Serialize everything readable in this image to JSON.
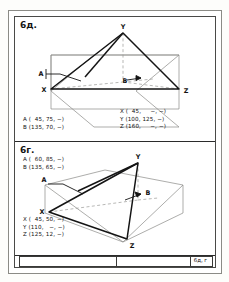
{
  "page": {
    "kind": "technical-drawing-sheet",
    "panels": [
      {
        "id": "top",
        "label": "6д.",
        "figure": {
          "vertex_labels": [
            "Y",
            "A",
            "X",
            "B",
            "Z"
          ],
          "apex": "Y",
          "left_base": "X",
          "right_base": "Z",
          "plane_markers": [
            "A",
            "B"
          ]
        },
        "coords_left": [
          "A (  45, 75, −)",
          "B (135, 70, −)"
        ],
        "coords_right": [
          "X (  45,     −, −)",
          "Y (100, 125, −)",
          "Z (160,     −, −)"
        ]
      },
      {
        "id": "bottom",
        "label": "6г.",
        "figure": {
          "vertex_labels": [
            "Y",
            "A",
            "X",
            "B",
            "Z"
          ],
          "apex": "Y",
          "left_base": "X",
          "right_base": "Z",
          "plane_markers": [
            "A",
            "B"
          ]
        },
        "coords_left": [
          "A (  60, 85, −)",
          "B (135, 65, −)"
        ],
        "coords_bottom": [
          "X (  45, 50, −)",
          "Y (110,   −, −)",
          "Z (125, 12, −)"
        ]
      }
    ],
    "title_block": {
      "left_cell": "",
      "middle_cell": "",
      "right_cell": "6д, г"
    },
    "colors": {
      "ink": "#141414",
      "thin_line": "#8a8a86",
      "frame": "#4a4a48",
      "paper": "#ffffff"
    }
  }
}
